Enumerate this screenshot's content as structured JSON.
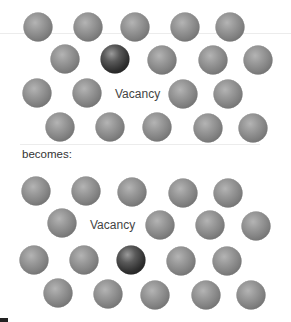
{
  "figure": {
    "top_panel": {
      "label": "Vacancy",
      "label_pos": {
        "x": 115,
        "y": 94
      },
      "atoms": [
        {
          "x": 38,
          "y": 27,
          "type": "host"
        },
        {
          "x": 88,
          "y": 27,
          "type": "host"
        },
        {
          "x": 135,
          "y": 27,
          "type": "host"
        },
        {
          "x": 185,
          "y": 27,
          "type": "host"
        },
        {
          "x": 230,
          "y": 27,
          "type": "host"
        },
        {
          "x": 65,
          "y": 59,
          "type": "host"
        },
        {
          "x": 115,
          "y": 59,
          "type": "migrating"
        },
        {
          "x": 162,
          "y": 60,
          "type": "host"
        },
        {
          "x": 213,
          "y": 60,
          "type": "host"
        },
        {
          "x": 258,
          "y": 60,
          "type": "host"
        },
        {
          "x": 37,
          "y": 93,
          "type": "host"
        },
        {
          "x": 87,
          "y": 93,
          "type": "host"
        },
        {
          "x": 183,
          "y": 94,
          "type": "host"
        },
        {
          "x": 228,
          "y": 94,
          "type": "host"
        },
        {
          "x": 60,
          "y": 127,
          "type": "host"
        },
        {
          "x": 110,
          "y": 127,
          "type": "host"
        },
        {
          "x": 157,
          "y": 127,
          "type": "host"
        },
        {
          "x": 208,
          "y": 128,
          "type": "host"
        },
        {
          "x": 253,
          "y": 128,
          "type": "host"
        }
      ]
    },
    "transition_text": "becomes:",
    "bottom_panel": {
      "label": "Vacancy",
      "label_pos": {
        "x": 90,
        "y": 225
      },
      "atoms": [
        {
          "x": 36,
          "y": 191,
          "type": "host"
        },
        {
          "x": 86,
          "y": 191,
          "type": "host"
        },
        {
          "x": 132,
          "y": 192,
          "type": "host"
        },
        {
          "x": 183,
          "y": 193,
          "type": "host"
        },
        {
          "x": 228,
          "y": 193,
          "type": "host"
        },
        {
          "x": 62,
          "y": 223,
          "type": "host"
        },
        {
          "x": 160,
          "y": 225,
          "type": "host"
        },
        {
          "x": 210,
          "y": 225,
          "type": "host"
        },
        {
          "x": 256,
          "y": 226,
          "type": "host"
        },
        {
          "x": 34,
          "y": 260,
          "type": "host"
        },
        {
          "x": 84,
          "y": 260,
          "type": "host"
        },
        {
          "x": 131,
          "y": 260,
          "type": "migrating"
        },
        {
          "x": 181,
          "y": 261,
          "type": "host"
        },
        {
          "x": 227,
          "y": 261,
          "type": "host"
        },
        {
          "x": 58,
          "y": 293,
          "type": "host"
        },
        {
          "x": 108,
          "y": 294,
          "type": "host"
        },
        {
          "x": 155,
          "y": 295,
          "type": "host"
        },
        {
          "x": 206,
          "y": 295,
          "type": "host"
        },
        {
          "x": 251,
          "y": 295,
          "type": "host"
        }
      ]
    },
    "colors": {
      "host_atom": "#8a8a8a",
      "migrating_atom": "#2e2e2e",
      "label": "#444444"
    }
  }
}
